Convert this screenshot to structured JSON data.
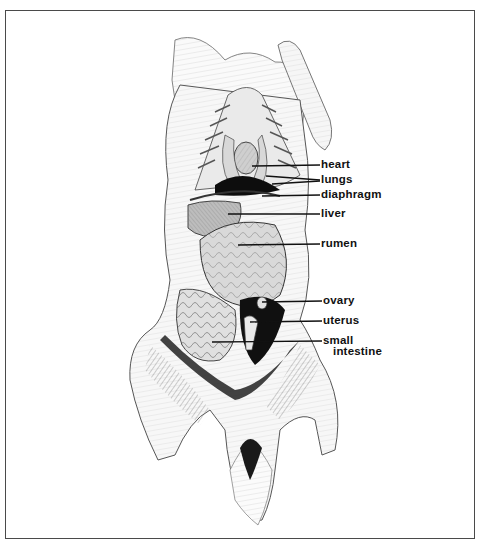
{
  "figure": {
    "frame_color": "#4a4a4a",
    "ink_color": "#111111"
  },
  "labels": [
    {
      "id": "heart",
      "text": "heart",
      "x": 321,
      "y": 159
    },
    {
      "id": "lungs",
      "text": "lungs",
      "x": 321,
      "y": 174
    },
    {
      "id": "diaphragm",
      "text": "diaphragm",
      "x": 321,
      "y": 189
    },
    {
      "id": "liver",
      "text": "liver",
      "x": 321,
      "y": 208
    },
    {
      "id": "rumen",
      "text": "rumen",
      "x": 321,
      "y": 238
    },
    {
      "id": "ovary",
      "text": "ovary",
      "x": 323,
      "y": 295
    },
    {
      "id": "uterus",
      "text": "uterus",
      "x": 323,
      "y": 315
    },
    {
      "id": "small_intestine_1",
      "text": "small",
      "x": 323,
      "y": 335
    },
    {
      "id": "small_intestine_2",
      "text": "intestine",
      "x": 333,
      "y": 346
    }
  ],
  "leaders": [
    {
      "label": "heart",
      "x1": 252,
      "y1": 166,
      "x2": 320,
      "y2": 165
    },
    {
      "label": "lungs",
      "x1": 266,
      "y1": 176,
      "x2": 320,
      "y2": 180
    },
    {
      "label": "lungs",
      "x1": 272,
      "y1": 184,
      "x2": 320,
      "y2": 181
    },
    {
      "label": "diaphragm",
      "x1": 262,
      "y1": 196,
      "x2": 320,
      "y2": 195
    },
    {
      "label": "liver",
      "x1": 228,
      "y1": 214,
      "x2": 320,
      "y2": 214
    },
    {
      "label": "rumen",
      "x1": 238,
      "y1": 245,
      "x2": 320,
      "y2": 244
    },
    {
      "label": "ovary",
      "x1": 262,
      "y1": 302,
      "x2": 322,
      "y2": 301
    },
    {
      "label": "uterus",
      "x1": 250,
      "y1": 322,
      "x2": 322,
      "y2": 321
    },
    {
      "label": "small intestine",
      "x1": 212,
      "y1": 342,
      "x2": 322,
      "y2": 341
    }
  ]
}
